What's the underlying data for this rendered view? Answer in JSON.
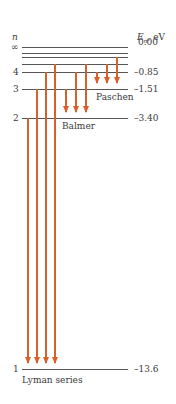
{
  "axes": {
    "n_label": "n",
    "energy_label_main": "E",
    "energy_label_sub": "n",
    "energy_label_unit": ", eV"
  },
  "levels": [
    {
      "n": "∞",
      "energy": "0.00",
      "y": 47
    },
    {
      "n": "",
      "energy": "",
      "y": 53
    },
    {
      "n": "",
      "energy": "",
      "y": 57
    },
    {
      "n": "",
      "energy": "",
      "y": 64
    },
    {
      "n": "4",
      "energy": "–0.85",
      "y": 72
    },
    {
      "n": "3",
      "energy": "–1.51",
      "y": 89
    },
    {
      "n": "2",
      "energy": "–3.40",
      "y": 118
    },
    {
      "n": "1",
      "energy": "–13.6",
      "y": 369
    }
  ],
  "series": [
    {
      "name": "Lyman series",
      "color": "#d9602a",
      "transitions": [
        {
          "x": 28,
          "from_y": 118,
          "to_y": 369
        },
        {
          "x": 37,
          "from_y": 89,
          "to_y": 369
        },
        {
          "x": 46,
          "from_y": 72,
          "to_y": 369
        },
        {
          "x": 55,
          "from_y": 64,
          "to_y": 369
        }
      ]
    },
    {
      "name": "Balmer",
      "color": "#d9602a",
      "transitions": [
        {
          "x": 66,
          "from_y": 89,
          "to_y": 118
        },
        {
          "x": 76,
          "from_y": 72,
          "to_y": 118
        },
        {
          "x": 86,
          "from_y": 64,
          "to_y": 118
        }
      ]
    },
    {
      "name": "Paschen",
      "color": "#d9602a",
      "transitions": [
        {
          "x": 97,
          "from_y": 72,
          "to_y": 89
        },
        {
          "x": 107,
          "from_y": 64,
          "to_y": 89
        },
        {
          "x": 117,
          "from_y": 57,
          "to_y": 89
        }
      ]
    }
  ],
  "labels": {
    "lyman": "Lyman series",
    "balmer": "Balmer",
    "paschen": "Paschen"
  }
}
